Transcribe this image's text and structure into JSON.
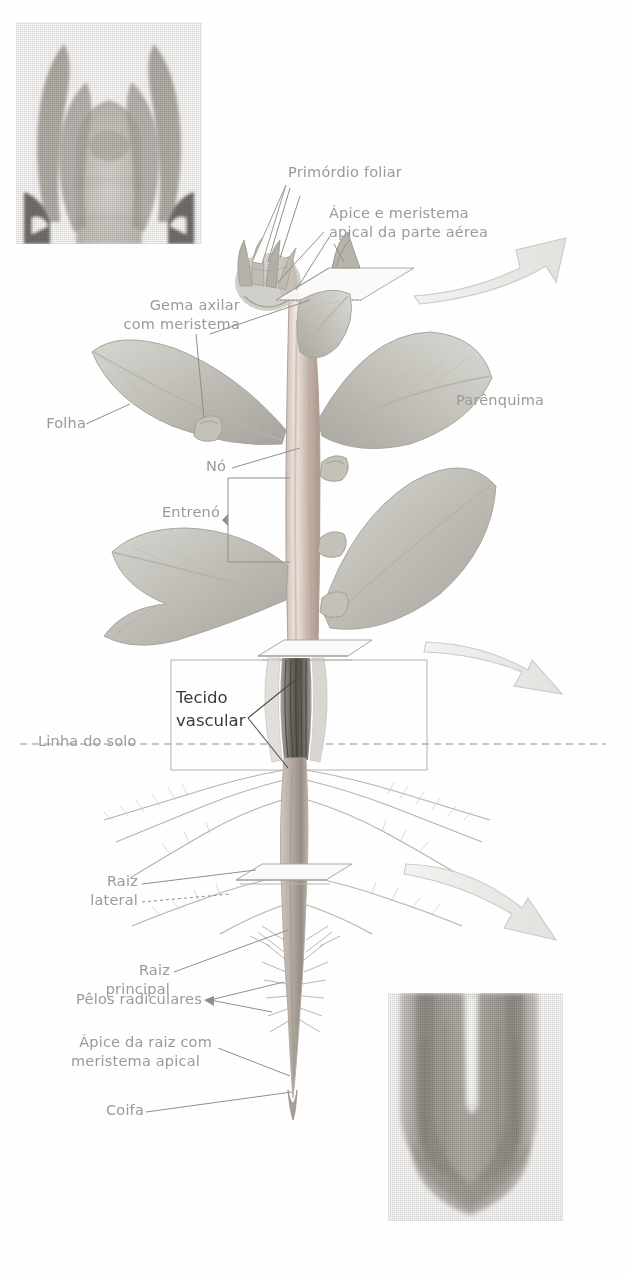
{
  "figure": {
    "language": "pt-BR",
    "style": "desenho botânico sombreado em tons de cinza com duas micrografias"
  },
  "colors": {
    "label_text": "#9a9a97",
    "label_text_dark": "#3a3a3a",
    "leader_line": "#8e8e8b",
    "plant_stem": "#b9a9a0",
    "plant_leaf": "#bdbdb6",
    "vascular_tissue": "#7c7a74",
    "arrow_outline": "#c8c6c2",
    "micrograph": "#b3b1ab",
    "background": "#ffffff"
  },
  "labels": {
    "primordio_foliar": "Primórdio foliar",
    "apice_meristema_aerea_line1": "Ápice e meristema",
    "apice_meristema_aerea_line2": "apical da parte aérea",
    "gema_axilar_line1": "Gema axilar",
    "gema_axilar_line2": "com meristema",
    "folha": "Folha",
    "no": "Nó",
    "entreno": "Entrenó",
    "parenquima": "Parênquima",
    "linha_do_solo": "Linha do solo",
    "tecido_vascular_line1": "Tecido",
    "tecido_vascular_line2": "vascular",
    "raiz_lateral_line1": "Raiz",
    "raiz_lateral_line2": "lateral",
    "raiz_principal_line1": "Raiz",
    "raiz_principal_line2": "principal",
    "pelos_radiculares": "Pêlos radiculares",
    "apice_raiz_line1": "Ápice da raiz com",
    "apice_raiz_line2": "meristema apical",
    "coifa": "Coifa"
  },
  "micrographs": {
    "shoot_apex": {
      "name": "Micrografia do ápice caulinar",
      "position": "canto superior esquerdo"
    },
    "root_tip": {
      "name": "Micrografia do ápice radicular",
      "position": "canto inferior direito"
    }
  },
  "callout_arrows": [
    {
      "name": "seta-para-micrografia-apice-caulinar",
      "direction": "cima-direita"
    },
    {
      "name": "seta-para-detalhe-tecido-vascular",
      "direction": "direita"
    },
    {
      "name": "seta-para-micrografia-apice-radicular",
      "direction": "baixo-direita"
    }
  ],
  "cut_planes": [
    {
      "name": "plano-de-corte-apice-caulinar"
    },
    {
      "name": "plano-de-corte-caule-base"
    },
    {
      "name": "plano-de-corte-raiz-principal"
    }
  ],
  "inset_box": {
    "name": "recorte-do-tecido-vascular",
    "label": "Tecido vascular"
  }
}
